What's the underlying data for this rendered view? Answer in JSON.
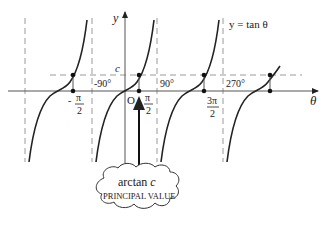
{
  "diagram": {
    "title": "y = tan θ",
    "function_label": "y = tan θ",
    "axes": {
      "x_label": "θ",
      "y_label": "y",
      "origin_label": "O"
    },
    "horizontal_line_label": "c",
    "asymptote_degree_labels": [
      "-90°",
      "90°",
      "270°"
    ],
    "point_labels": [
      {
        "num": "π",
        "den": "2",
        "sign": "-"
      },
      {
        "num": "π",
        "den": "2",
        "sign": ""
      },
      {
        "num": "3π",
        "den": "2",
        "sign": ""
      }
    ],
    "callout": {
      "line1": "arctan c",
      "line1_main": "arctan ",
      "line1_var": "c",
      "line2": "PRINCIPAL VALUE"
    },
    "colors": {
      "curve": "#222222",
      "axis": "#444444",
      "dashed": "#999999"
    }
  }
}
